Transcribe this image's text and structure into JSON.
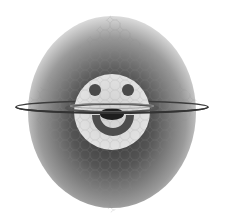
{
  "artwork": {
    "subject": "smiley-face planet with rings",
    "style": "grayscale",
    "colors": {
      "background": "#ffffff",
      "planet_center": "#3a3a3a",
      "planet_edge": "#c8c8c8",
      "face": "#d9d9d9",
      "features": "#4a4a4a",
      "ring": "#3c3c3c",
      "pattern_stroke": "#8a8a8a"
    },
    "planet": {
      "cx": 112,
      "cy": 112,
      "rx": 84,
      "ry": 96
    },
    "face": {
      "cx": 112,
      "cy": 112,
      "r": 38
    },
    "eyes": [
      {
        "cx": 95,
        "cy": 90,
        "r": 6
      },
      {
        "cx": 128,
        "cy": 90,
        "r": 6
      }
    ],
    "rings": [
      {
        "name": "outer",
        "cx": 112,
        "cy": 107,
        "rx": 96,
        "ry": 6
      },
      {
        "name": "inner",
        "cx": 112,
        "cy": 108,
        "rx": 46,
        "ry": 4
      }
    ]
  }
}
